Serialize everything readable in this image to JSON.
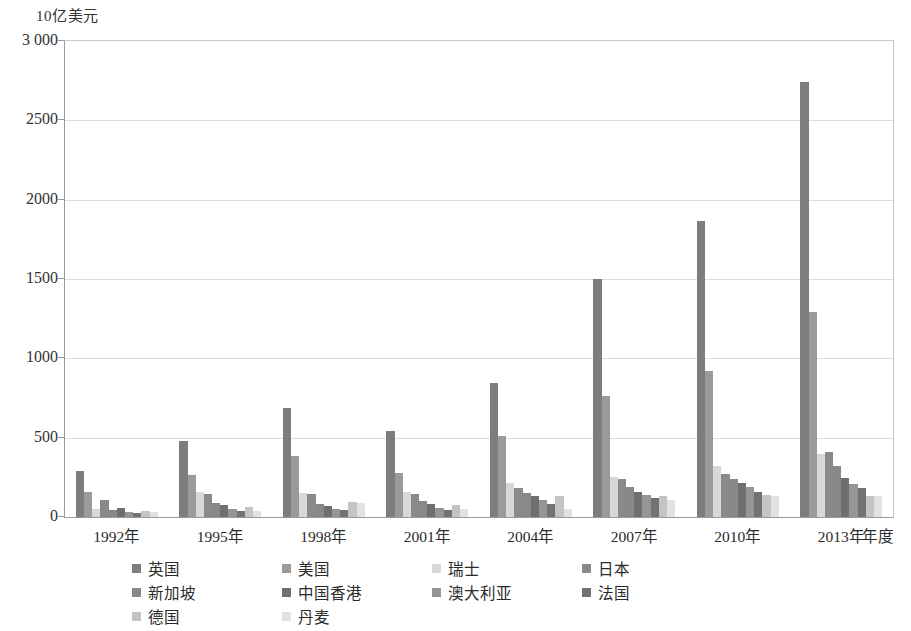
{
  "chart_data": {
    "type": "bar",
    "title": "",
    "subtitle": "",
    "ylabel": "10亿美元",
    "xlabel": "年度",
    "ylim": [
      0,
      3000
    ],
    "yticks": [
      0,
      500,
      1000,
      1500,
      2000,
      2500,
      3000
    ],
    "ytick_labels": [
      "0",
      "500",
      "1000",
      "1500",
      "2000",
      "2500",
      "3 000"
    ],
    "grid": true,
    "legend_position": "bottom",
    "categories": [
      "1992年",
      "1995年",
      "1998年",
      "2001年",
      "2004年",
      "2007年",
      "2010年",
      "2013年"
    ],
    "series": [
      {
        "name": "英国",
        "color": "#7d7d7d",
        "values": [
          290,
          480,
          685,
          545,
          845,
          1500,
          1865,
          2740
        ]
      },
      {
        "name": "美国",
        "color": "#9a9a9a",
        "values": [
          155,
          265,
          385,
          275,
          510,
          760,
          920,
          1290
        ]
      },
      {
        "name": "瑞士",
        "color": "#d8d8d8",
        "values": [
          50,
          160,
          150,
          155,
          215,
          250,
          320,
          395
        ]
      },
      {
        "name": "日本",
        "color": "#8a8a8a",
        "values": [
          110,
          145,
          145,
          145,
          185,
          240,
          270,
          410
        ]
      },
      {
        "name": "新加坡",
        "color": "#888888",
        "values": [
          45,
          90,
          85,
          100,
          150,
          190,
          240,
          320
        ]
      },
      {
        "name": "中国香港",
        "color": "#6f6f6f",
        "values": [
          55,
          75,
          70,
          85,
          130,
          160,
          215,
          245
        ]
      },
      {
        "name": "澳大利亚",
        "color": "#959595",
        "values": [
          30,
          50,
          50,
          55,
          110,
          140,
          190,
          210
        ]
      },
      {
        "name": "法国",
        "color": "#727272",
        "values": [
          25,
          40,
          45,
          45,
          85,
          120,
          160,
          185
        ]
      },
      {
        "name": "德国",
        "color": "#c4c4c4",
        "values": [
          35,
          60,
          95,
          75,
          130,
          135,
          140,
          135
        ]
      },
      {
        "name": "丹麦",
        "color": "#e2e2e2",
        "values": [
          30,
          35,
          90,
          50,
          50,
          105,
          130,
          130
        ]
      }
    ]
  },
  "legend": {
    "rows": [
      [
        "英国",
        "美国",
        "瑞士",
        "日本"
      ],
      [
        "新加坡",
        "中国香港",
        "澳大利亚",
        "法国"
      ],
      [
        "德国",
        "丹麦"
      ]
    ]
  }
}
